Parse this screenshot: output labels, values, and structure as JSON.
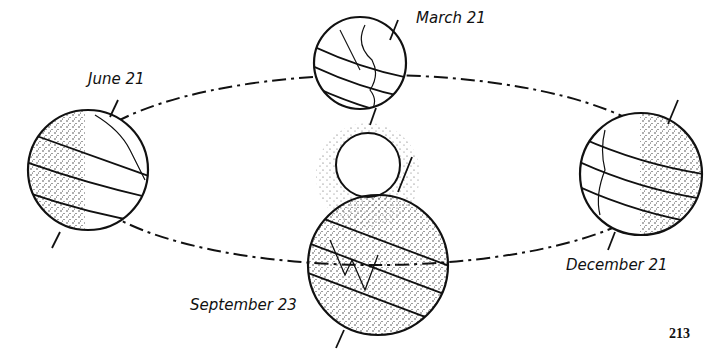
{
  "diagram": {
    "type": "earth-orbit-seasons",
    "labels": {
      "march": "March 21",
      "june": "June 21",
      "september": "September 23",
      "december": "December 21"
    },
    "page_number": "213"
  }
}
